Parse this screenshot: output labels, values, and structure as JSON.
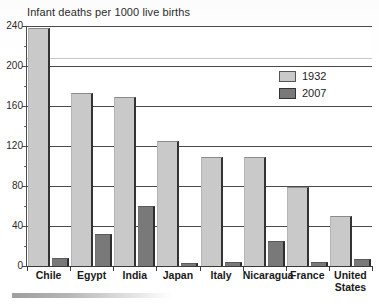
{
  "chart_data": {
    "type": "bar",
    "title": "Infant deaths per 1000 live births",
    "xlabel": "",
    "ylabel": "",
    "ylim": [
      0,
      240
    ],
    "yticks": [
      0,
      40,
      80,
      120,
      160,
      200,
      240
    ],
    "ytick_labels": [
      "0",
      "40",
      "80",
      "120",
      "160",
      "200",
      "240"
    ],
    "grid": true,
    "legend_position": "upper right",
    "categories": [
      "Chile",
      "Egypt",
      "India",
      "Japan",
      "Italy",
      "Nicaragua",
      "France",
      "United States"
    ],
    "category_labels": [
      "Chile",
      "Egypt",
      "India",
      "Japan",
      "Italy",
      "Nicaragua",
      "France",
      "United\nStates"
    ],
    "series": [
      {
        "name": "1932",
        "color": "#c9c9c9",
        "values": [
          238,
          173,
          169,
          125,
          109,
          109,
          79,
          50
        ]
      },
      {
        "name": "2007",
        "color": "#797979",
        "values": [
          8,
          32,
          60,
          3,
          4,
          25,
          4,
          7
        ]
      }
    ]
  },
  "legend": {
    "items": [
      {
        "label": "1932",
        "swatch": "light-gray"
      },
      {
        "label": "2007",
        "swatch": "dark-gray"
      }
    ]
  }
}
